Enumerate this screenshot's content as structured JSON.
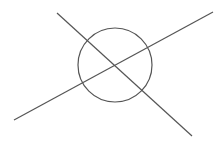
{
  "diagram": {
    "stroke_color": "#555555",
    "background": "#ffffff",
    "circle": {
      "cx": 115,
      "cy": 65,
      "r": 37
    },
    "lines": [
      {
        "name": "line-descending",
        "x1": 57,
        "y1": 13,
        "x2": 192,
        "y2": 136
      },
      {
        "name": "line-ascending",
        "x1": 14,
        "y1": 120,
        "x2": 213,
        "y2": 12
      }
    ]
  }
}
